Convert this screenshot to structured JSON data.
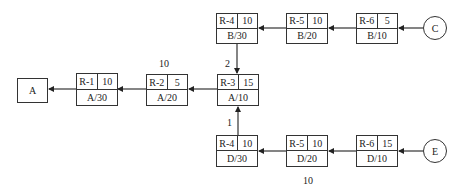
{
  "diagram": {
    "sink": {
      "label": "A"
    },
    "sources": [
      {
        "id": "C",
        "label": "C"
      },
      {
        "id": "E",
        "label": "E"
      }
    ],
    "middle_row": [
      {
        "resource": "R-1",
        "value": "10",
        "tag": "A/30"
      },
      {
        "resource": "R-2",
        "value": "5",
        "tag": "A/20"
      },
      {
        "resource": "R-3",
        "value": "15",
        "tag": "A/10"
      }
    ],
    "top_row": [
      {
        "resource": "R-4",
        "value": "10",
        "tag": "B/30"
      },
      {
        "resource": "R-5",
        "value": "10",
        "tag": "B/20"
      },
      {
        "resource": "R-6",
        "value": "5",
        "tag": "B/10"
      }
    ],
    "bottom_row": [
      {
        "resource": "R-4",
        "value": "10",
        "tag": "D/30"
      },
      {
        "resource": "R-5",
        "value": "10",
        "tag": "D/20"
      },
      {
        "resource": "R-6",
        "value": "15",
        "tag": "D/10"
      }
    ],
    "annotations": {
      "above_r2": "10",
      "top_branch": "2",
      "bottom_branch": "1",
      "below_bottom": "10"
    }
  }
}
